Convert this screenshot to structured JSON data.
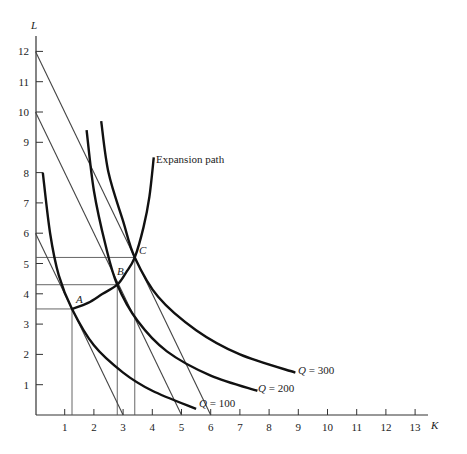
{
  "chart_data": {
    "type": "line",
    "title": "",
    "xlabel": "K",
    "ylabel": "L",
    "xlim": [
      0,
      14
    ],
    "ylim": [
      0,
      12.5
    ],
    "xticks": [
      1,
      2,
      3,
      4,
      5,
      6,
      7,
      8,
      9,
      10,
      11,
      12,
      13
    ],
    "yticks": [
      1,
      2,
      3,
      4,
      5,
      6,
      7,
      8,
      9,
      10,
      11,
      12
    ],
    "grid": false,
    "isoquants": [
      {
        "name": "Q = 100",
        "points": [
          [
            0.25,
            8.0
          ],
          [
            0.5,
            6.0
          ],
          [
            0.8,
            4.6
          ],
          [
            1.25,
            3.5
          ],
          [
            2.0,
            2.3
          ],
          [
            3.0,
            1.4
          ],
          [
            4.0,
            0.8
          ],
          [
            5.5,
            0.2
          ]
        ]
      },
      {
        "name": "Q = 200",
        "points": [
          [
            1.75,
            9.4
          ],
          [
            2.0,
            7.4
          ],
          [
            2.4,
            5.6
          ],
          [
            2.8,
            4.3
          ],
          [
            3.5,
            3.1
          ],
          [
            4.5,
            2.1
          ],
          [
            6.0,
            1.3
          ],
          [
            7.6,
            0.8
          ]
        ]
      },
      {
        "name": "Q = 300",
        "points": [
          [
            2.25,
            9.7
          ],
          [
            2.5,
            8.0
          ],
          [
            3.0,
            6.4
          ],
          [
            3.4,
            5.2
          ],
          [
            4.2,
            3.9
          ],
          [
            5.5,
            2.8
          ],
          [
            7.0,
            2.0
          ],
          [
            8.9,
            1.4
          ]
        ]
      }
    ],
    "isocost_lines": [
      {
        "points": [
          [
            0,
            6
          ],
          [
            3,
            0
          ]
        ]
      },
      {
        "points": [
          [
            0,
            10
          ],
          [
            5,
            0
          ]
        ]
      },
      {
        "points": [
          [
            0,
            12
          ],
          [
            6,
            0
          ]
        ]
      }
    ],
    "expansion_path": {
      "name": "Expansion path",
      "points": [
        [
          1.25,
          3.5
        ],
        [
          1.8,
          3.7
        ],
        [
          2.3,
          4.0
        ],
        [
          2.8,
          4.3
        ],
        [
          3.1,
          4.7
        ],
        [
          3.4,
          5.2
        ],
        [
          3.7,
          6.2
        ],
        [
          3.9,
          7.2
        ],
        [
          4.05,
          8.5
        ]
      ]
    },
    "points": [
      {
        "label": "A",
        "K": 1.25,
        "L": 3.5
      },
      {
        "label": "B",
        "K": 2.8,
        "L": 4.3
      },
      {
        "label": "C",
        "K": 3.4,
        "L": 5.2
      }
    ],
    "annotations": [
      "Expansion path",
      "Q = 100",
      "Q = 200",
      "Q = 300",
      "A",
      "B",
      "C"
    ]
  },
  "labels": {
    "y_axis": "L",
    "x_axis": "K",
    "expansion": "Expansion path",
    "q100": "Q = 100",
    "q200": "Q = 200",
    "q300": "Q = 300",
    "a": "A",
    "b": "B",
    "c": "C"
  }
}
